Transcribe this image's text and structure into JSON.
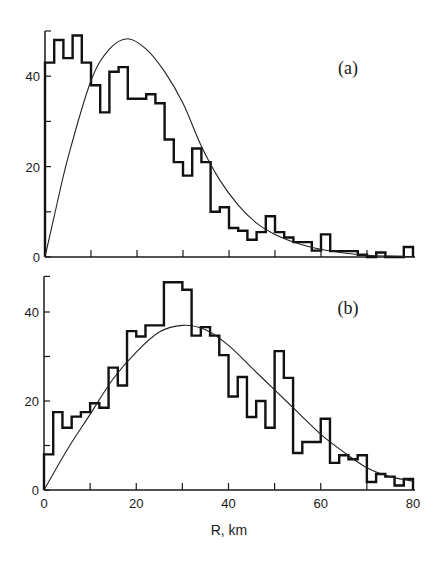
{
  "chart_data": [
    {
      "type": "bar",
      "subtype": "histogram-with-fitted-curve",
      "panel_label": "(a)",
      "title": "",
      "xlabel": "",
      "ylabel": "",
      "xlim": [
        0,
        80
      ],
      "ylim": [
        0,
        50
      ],
      "x_ticks": [
        0,
        10,
        20,
        30,
        40,
        50,
        60,
        70,
        80
      ],
      "x_tick_labels": [],
      "y_ticks": [
        0,
        10,
        20,
        30,
        40,
        50
      ],
      "y_tick_labels": [
        {
          "value": 0,
          "label": "0"
        },
        {
          "value": 20,
          "label": "20"
        },
        {
          "value": 40,
          "label": "40"
        }
      ],
      "grid": false,
      "bin_width": 2,
      "bin_edges_start": 0,
      "histogram_values": [
        43,
        48,
        44,
        49,
        43,
        38,
        32,
        41,
        42,
        35,
        35,
        36,
        34,
        26,
        21,
        18,
        24,
        21,
        10,
        11,
        6.4,
        5.8,
        3.8,
        5.5,
        9,
        5.5,
        4.3,
        3.3,
        3.3,
        1.4,
        5,
        1.3,
        1.3,
        1.3,
        0.5,
        0,
        1,
        0,
        0,
        2.2
      ],
      "curve": {
        "x": [
          0,
          2,
          5,
          10,
          14,
          18,
          22,
          26,
          30,
          34,
          38,
          42,
          46,
          50,
          55,
          60,
          65,
          70,
          75,
          80
        ],
        "y": [
          0,
          9,
          22,
          39,
          46,
          48.3,
          46,
          41,
          34,
          24.5,
          17,
          11.5,
          7.5,
          5,
          3,
          1.7,
          0.9,
          0.4,
          0.2,
          0.1
        ]
      }
    },
    {
      "type": "bar",
      "subtype": "histogram-with-fitted-curve",
      "panel_label": "(b)",
      "title": "",
      "xlabel": "R, km",
      "ylabel": "",
      "xlim": [
        0,
        80
      ],
      "ylim": [
        0,
        48
      ],
      "x_ticks": [
        0,
        10,
        20,
        30,
        40,
        50,
        60,
        70,
        80
      ],
      "x_tick_labels": [
        {
          "value": 0,
          "label": "0"
        },
        {
          "value": 20,
          "label": "20"
        },
        {
          "value": 40,
          "label": "40"
        },
        {
          "value": 60,
          "label": "60"
        },
        {
          "value": 80,
          "label": "80"
        }
      ],
      "y_ticks": [
        0,
        10,
        20,
        30,
        40,
        48
      ],
      "y_tick_labels": [
        {
          "value": 0,
          "label": "0"
        },
        {
          "value": 20,
          "label": "20"
        },
        {
          "value": 40,
          "label": "40"
        }
      ],
      "grid": false,
      "bin_width": 2,
      "bin_edges_start": 0,
      "histogram_values": [
        8,
        17.5,
        14,
        16.5,
        17.5,
        19.5,
        18.5,
        27.5,
        23.5,
        35.7,
        34.5,
        37,
        37,
        46.7,
        46.7,
        45,
        34.7,
        36.6,
        34.7,
        30.3,
        21,
        25.4,
        16.4,
        20,
        14,
        31.2,
        25.2,
        8.3,
        10.8,
        10.8,
        16,
        6.1,
        7.8,
        6.9,
        7.8,
        1.8,
        3.6,
        3,
        1,
        2.5
      ],
      "curve": {
        "x": [
          0,
          5,
          10,
          15,
          20,
          25,
          30,
          35,
          40,
          45,
          50,
          55,
          60,
          65,
          70,
          75,
          80
        ],
        "y": [
          0,
          9,
          17,
          25,
          31,
          35.5,
          37,
          36,
          32.5,
          27.5,
          22.5,
          17.5,
          12.5,
          8.5,
          5,
          3,
          2
        ]
      }
    }
  ]
}
